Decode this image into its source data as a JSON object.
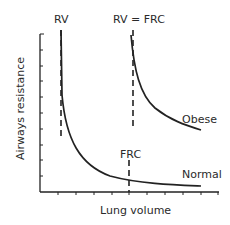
{
  "diagram": {
    "axes": {
      "xlabel": "Lung volume",
      "ylabel": "Airways resistance",
      "x_ticks": 10,
      "y_ticks": 10
    },
    "labels": {
      "rv": "RV",
      "rv_eq_frc": "RV = FRC",
      "frc": "FRC",
      "obese": "Obese",
      "normal": "Normal"
    },
    "curves": [
      {
        "name": "Normal",
        "shape": "hyperbolic decay",
        "asymptote_at": "RV"
      },
      {
        "name": "Obese",
        "shape": "hyperbolic decay",
        "asymptote_at": "RV = FRC"
      }
    ],
    "markers": [
      {
        "name": "RV",
        "style": "dashed vertical"
      },
      {
        "name": "RV = FRC",
        "style": "dashed vertical"
      },
      {
        "name": "FRC",
        "style": "dashed vertical"
      }
    ],
    "colors": {
      "line": "#222222",
      "text": "#2a2a2a",
      "background": "#ffffff"
    }
  }
}
